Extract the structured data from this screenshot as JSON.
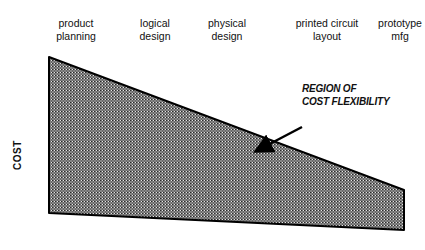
{
  "stages": [
    {
      "line1": "product",
      "line2": "planning",
      "x": 76
    },
    {
      "line1": "logical",
      "line2": "design",
      "x": 155
    },
    {
      "line1": "physical",
      "line2": "design",
      "x": 227
    },
    {
      "line1": "printed circuit",
      "line2": "layout",
      "x": 327
    },
    {
      "line1": "prototype",
      "line2": "mfg",
      "x": 400
    }
  ],
  "y_axis_label": "COST",
  "callout": {
    "line1": "REGION OF",
    "line2": "COST FLEXIBILITY"
  },
  "shape": {
    "fill_pattern": "crosshatch-dots",
    "fill_color": "#5a5a5a",
    "stroke_color": "#000000",
    "vertices": [
      [
        49,
        57
      ],
      [
        404,
        190
      ],
      [
        404,
        230
      ],
      [
        49,
        213
      ]
    ]
  }
}
